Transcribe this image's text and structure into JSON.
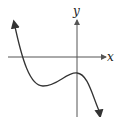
{
  "graph": {
    "x_label": "x",
    "y_label": "y",
    "curve_description": "cubic-like curve rising from upper left, crossing x-axis, local minimum below x-axis, local maximum just left of y-axis below x-axis, falling to lower right",
    "colors": {
      "axis": "#555555",
      "curve": "#333333",
      "background": "#ffffff"
    }
  }
}
